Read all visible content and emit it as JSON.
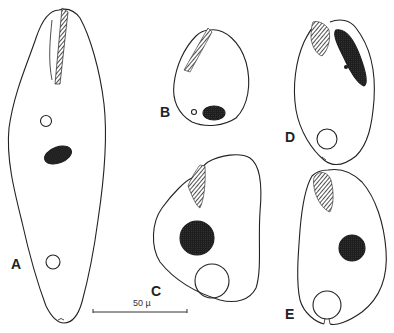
{
  "figure": {
    "panels": [
      {
        "id": "A",
        "label": "A"
      },
      {
        "id": "B",
        "label": "B"
      },
      {
        "id": "C",
        "label": "C"
      },
      {
        "id": "D",
        "label": "D"
      },
      {
        "id": "E",
        "label": "E"
      }
    ],
    "scale_bar": {
      "label": "50 µ"
    },
    "colors": {
      "ink": "#222222",
      "background": "#ffffff"
    }
  }
}
